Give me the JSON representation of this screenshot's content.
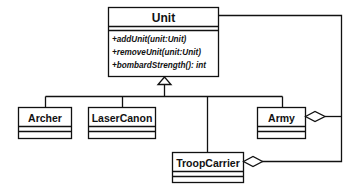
{
  "diagram": {
    "type": "uml-class-diagram",
    "classes": {
      "unit": {
        "name": "Unit",
        "operations": [
          "+addUnit(unit:Unit)",
          "+removeUnit(unit:Unit)",
          "+bombardStrength(): int"
        ]
      },
      "archer": {
        "name": "Archer"
      },
      "laser_canon": {
        "name": "LaserCanon"
      },
      "army": {
        "name": "Army"
      },
      "troop_carrier": {
        "name": "TroopCarrier"
      }
    },
    "relationships": [
      {
        "type": "generalization",
        "from": "Archer",
        "to": "Unit"
      },
      {
        "type": "generalization",
        "from": "LaserCanon",
        "to": "Unit"
      },
      {
        "type": "generalization",
        "from": "TroopCarrier",
        "to": "Unit"
      },
      {
        "type": "generalization",
        "from": "Army",
        "to": "Unit"
      },
      {
        "type": "aggregation",
        "whole": "Army",
        "part": "Unit"
      },
      {
        "type": "aggregation",
        "whole": "TroopCarrier",
        "part": "Unit"
      }
    ],
    "colors": {
      "stroke": "#111111",
      "background": "#ffffff"
    }
  }
}
